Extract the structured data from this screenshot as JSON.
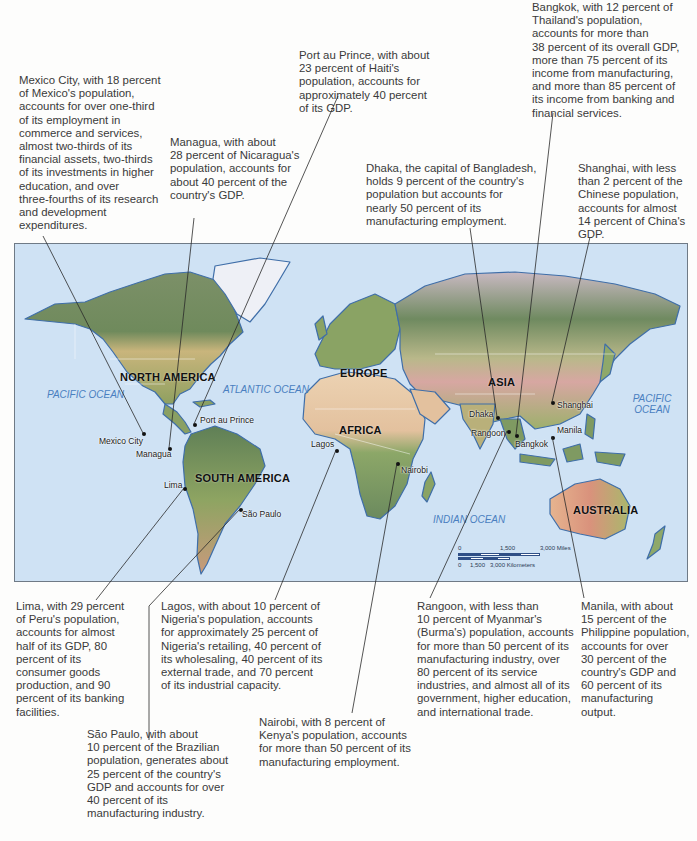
{
  "callouts": {
    "mexico_city": "Mexico City, with 18 percent\nof Mexico's population,\naccounts for over one-third\nof its employment in\ncommerce and services,\nalmost two-thirds of its\nfinancial assets, two-thirds\nof its investments in higher\neducation, and over\nthree-fourths of its research\nand development\nexpenditures.",
    "managua": "Managua, with about\n28 percent of Nicaragua's\npopulation, accounts for\nabout 40 percent of the\ncountry's GDP.",
    "port_au_prince": "Port au Prince, with about\n23 percent of Haiti's\npopulation, accounts for\napproximately 40 percent\nof its GDP.",
    "dhaka": "Dhaka, the capital of Bangladesh,\nholds 9 percent of the country's\npopulation but accounts for\nnearly 50 percent of its\nmanufacturing employment.",
    "bangkok": "Bangkok, with 12 percent of\nThailand's population,\naccounts for more than\n38 percent of its overall GDP,\nmore than 75 percent of its\nincome from manufacturing,\nand more than 85 percent of\nits income from banking and\nfinancial services.",
    "shanghai": "Shanghai, with less\nthan 2 percent of the\nChinese population,\naccounts for almost\n14 percent of China's\nGDP.",
    "lima": "Lima, with 29 percent\nof Peru's population,\naccounts for almost\nhalf of its GDP, 80\npercent of its\nconsumer goods\nproduction, and 90\npercent of its banking\nfacilities.",
    "lagos": "Lagos, with about 10 percent of\nNigeria's population, accounts\nfor approximately 25 percent of\nNigeria's retailing, 40 percent of\nits wholesaling, 40 percent of its\nexternal trade, and 70 percent\nof its industrial capacity.",
    "sao_paulo": "São Paulo, with about\n10 percent of the Brazilian\npopulation, generates about\n25 percent of the country's\nGDP and accounts for over\n40 percent of its\nmanufacturing industry.",
    "nairobi": "Nairobi, with 8 percent of\nKenya's population, accounts\nfor more than 50 percent of its\nmanufacturing employment.",
    "rangoon": "Rangoon, with less than\n10 percent of Myanmar's\n(Burma's) population, accounts\nfor more than 50 percent of its\nmanufacturing industry, over\n80 percent of its service\nindustries, and almost all of its\ngovernment, higher education,\nand international trade.",
    "manila": "Manila, with about\n15 percent of the\nPhilippine population,\naccounts for over\n30 percent of the\ncountry's GDP and\n60 percent of its\nmanufacturing\noutput."
  },
  "map": {
    "regions": {
      "north_america": "NORTH\nAMERICA",
      "south_america": "SOUTH\nAMERICA",
      "europe": "EUROPE",
      "africa": "AFRICA",
      "asia": "ASIA",
      "australia": "AUSTRALIA"
    },
    "oceans": {
      "pacific_west": "PACIFIC\nOCEAN",
      "atlantic": "ATLANTIC\nOCEAN",
      "indian": "INDIAN  OCEAN",
      "pacific_east": "PACIFIC\nOCEAN"
    },
    "cities": {
      "mexico_city": "Mexico City",
      "managua": "Managua",
      "port_au_prince": "Port au Prince",
      "lima": "Lima",
      "sao_paulo": "São Paulo",
      "lagos": "Lagos",
      "nairobi": "Nairobi",
      "dhaka": "Dhaka",
      "rangoon": "Rangoon",
      "bangkok": "Bangkok",
      "shanghai": "Shanghai",
      "manila": "Manila"
    },
    "scale": {
      "zero_miles": "0",
      "mid_miles": "1,500",
      "max_miles": "3,000 Miles",
      "zero_km": "0",
      "mid_km": "1,500",
      "max_km": "3,000 Kilometers"
    },
    "colors": {
      "ocean": "#cfe2f4",
      "land_green": "#8fa86a",
      "land_dark": "#5e7d58",
      "land_desert": "#e8c9a0",
      "land_red": "#d99a84",
      "ice": "#eef0f6",
      "coast": "#3f6ea8",
      "ocean_label": "#4a7fc0"
    }
  }
}
